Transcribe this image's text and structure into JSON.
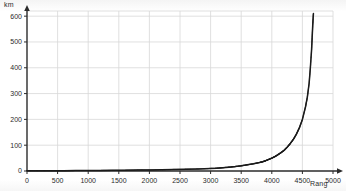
{
  "chart_data": {
    "type": "line",
    "title": "",
    "subtitle": "",
    "xlabel": "Rang",
    "ylabel": "km",
    "xlim": [
      0,
      5000
    ],
    "ylim": [
      0,
      620
    ],
    "grid": true,
    "legend": null,
    "x_ticks": [
      0,
      500,
      1000,
      1500,
      2000,
      2500,
      3000,
      3500,
      4000,
      4500,
      5000
    ],
    "x_tick_labels": [
      "0",
      "500",
      "1000",
      "1500",
      "2000",
      "2500",
      "3000",
      "3500",
      "4000",
      "4500",
      "5000"
    ],
    "y_ticks": [
      0,
      100,
      200,
      300,
      400,
      500,
      600
    ],
    "y_tick_labels": [
      "0",
      "100",
      "200",
      "300",
      "400",
      "500",
      "600"
    ],
    "series": [
      {
        "name": "Flusslänge nach Rang",
        "color": "#1c1c1c",
        "x": [
          0,
          200,
          400,
          600,
          800,
          1000,
          1200,
          1400,
          1600,
          1800,
          2000,
          2200,
          2400,
          2600,
          2800,
          3000,
          3100,
          3200,
          3300,
          3400,
          3500,
          3600,
          3700,
          3800,
          3850,
          3900,
          3950,
          4000,
          4050,
          4100,
          4150,
          4200,
          4250,
          4300,
          4350,
          4400,
          4450,
          4500,
          4550,
          4580,
          4610,
          4630,
          4650,
          4660,
          4670,
          4680
        ],
        "y": [
          1,
          1,
          1,
          1,
          2,
          2,
          2,
          3,
          3,
          4,
          4,
          5,
          6,
          7,
          8,
          10,
          11,
          13,
          15,
          17,
          20,
          24,
          28,
          33,
          36,
          40,
          45,
          50,
          56,
          63,
          71,
          80,
          92,
          106,
          122,
          142,
          167,
          200,
          248,
          285,
          340,
          400,
          470,
          520,
          570,
          610
        ]
      }
    ],
    "annotations": []
  },
  "chart": {
    "ylabel_text": "km",
    "xlabel_text": "Rang"
  }
}
